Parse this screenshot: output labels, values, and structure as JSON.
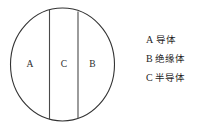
{
  "diagram": {
    "shape": "circle",
    "stroke_color": "#333333",
    "fill_color": "#ffffff",
    "regions": [
      {
        "id": "A",
        "label": "A",
        "position": "left"
      },
      {
        "id": "C",
        "label": "C",
        "position": "middle"
      },
      {
        "id": "B",
        "label": "B",
        "position": "right"
      }
    ]
  },
  "legend": {
    "items": [
      {
        "key": "A",
        "text": "导体"
      },
      {
        "key": "B",
        "text": "绝缘体"
      },
      {
        "key": "C",
        "text": "半导体"
      }
    ]
  }
}
